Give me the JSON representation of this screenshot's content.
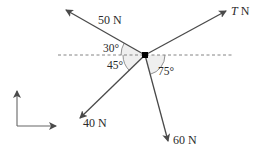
{
  "diagram": {
    "type": "free-body force diagram",
    "forces": [
      {
        "id": "f50",
        "label": "50 N",
        "angle_label": "30°",
        "direction": "up-left, 30° above horizontal"
      },
      {
        "id": "fT",
        "label_var": "T",
        "label_unit": " N",
        "direction": "up-right"
      },
      {
        "id": "f40",
        "label": "40 N",
        "angle_label": "45°",
        "direction": "down-left, 45° below horizontal"
      },
      {
        "id": "f60",
        "label": "60 N",
        "angle_label": "75°",
        "direction": "down-right, 75° below horizontal"
      }
    ],
    "reference_line": "dashed horizontal",
    "axes": {
      "x": "right",
      "y": "up"
    },
    "colors": {
      "line": "#4a4a4a",
      "dashed": "#777777",
      "arc_fill": "#eeeeee",
      "dot": "#000000"
    }
  }
}
